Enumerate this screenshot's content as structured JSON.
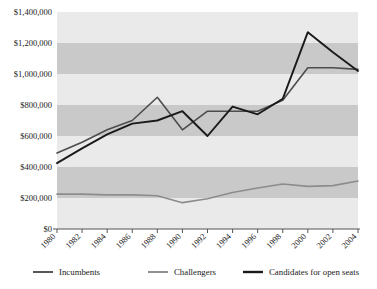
{
  "chart_data": {
    "type": "line",
    "title": "",
    "xlabel": "",
    "ylabel": "",
    "grid": "horizontal-bands",
    "legend_position": "bottom",
    "x": [
      1980,
      1982,
      1984,
      1986,
      1988,
      1990,
      1992,
      1994,
      1996,
      1998,
      2000,
      2002,
      2004
    ],
    "xtick_labels": [
      "1980",
      "1982",
      "1984",
      "1986",
      "1988",
      "1990",
      "1992",
      "1994",
      "1996",
      "1998",
      "2000",
      "2002",
      "2004"
    ],
    "ytick_labels": [
      "$0",
      "$200,000",
      "$400,000",
      "$600,000",
      "$800,000",
      "$1,000,000",
      "$1,200,000",
      "$1,400,000"
    ],
    "ytick_values": [
      0,
      200000,
      400000,
      600000,
      800000,
      1000000,
      1200000,
      1400000
    ],
    "ylim": [
      0,
      1400000
    ],
    "xlim": [
      1980,
      2004
    ],
    "series": [
      {
        "name": "Incumbents",
        "color": "#4d4d4d",
        "values": [
          490000,
          560000,
          640000,
          700000,
          850000,
          640000,
          760000,
          760000,
          760000,
          830000,
          1040000,
          1040000,
          1030000
        ]
      },
      {
        "name": "Challengers",
        "color": "#8c8c8c",
        "values": [
          225000,
          225000,
          220000,
          220000,
          215000,
          170000,
          195000,
          235000,
          265000,
          290000,
          275000,
          280000,
          310000
        ]
      },
      {
        "name": "Candidates for open seats",
        "color": "#1a1a1a",
        "values": [
          425000,
          520000,
          610000,
          680000,
          700000,
          760000,
          600000,
          790000,
          740000,
          840000,
          1270000,
          1140000,
          1020000
        ]
      }
    ]
  },
  "legend": {
    "items": [
      {
        "label": "Incumbents",
        "color": "#4d4d4d"
      },
      {
        "label": "Challengers",
        "color": "#8c8c8c"
      },
      {
        "label": "Candidates for open seats",
        "color": "#1a1a1a"
      }
    ]
  },
  "axis": {
    "band_light": "#eaeaea",
    "band_dark": "#c9c9c9",
    "axis_color": "#555555",
    "background": "#ffffff"
  }
}
